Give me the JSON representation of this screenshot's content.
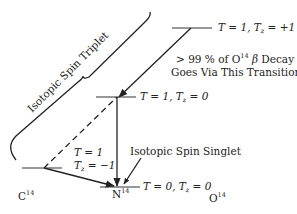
{
  "diagram": {
    "brace_label": "Isotopic Spin Triplet",
    "levels": {
      "o14": {
        "T": "1",
        "Tz": "+1",
        "label_text": "T = 1, Tz = +1"
      },
      "n14_excited": {
        "T": "1",
        "Tz": "0",
        "label_text": "T = 1, Tz = 0"
      },
      "c14": {
        "T": "1",
        "Tz": "−1",
        "label_line1": "T = 1",
        "label_line2": "Tz = −1"
      },
      "n14_ground": {
        "T": "0",
        "Tz": "0",
        "label_text": "T = 0, Tz = 0"
      }
    },
    "annotation_decay": {
      "line1_prefix": "> 99 % of O",
      "line1_sup": "14",
      "line1_suffix": "β Decay",
      "line2": "Goes Via This Transition"
    },
    "singlet_label": "Isotopic Spin Singlet",
    "nuclides": [
      {
        "symbol": "C",
        "mass": "14"
      },
      {
        "symbol": "N",
        "mass": "14"
      },
      {
        "symbol": "O",
        "mass": "14"
      }
    ],
    "colors": {
      "ink": "#222222",
      "background": "#ffffff"
    }
  }
}
